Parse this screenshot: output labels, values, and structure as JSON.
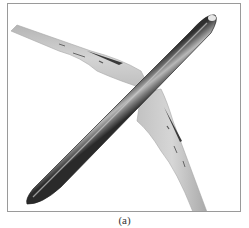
{
  "figure": {
    "caption": "(a)",
    "view": "top-down oblique view of swept-wing aircraft fuselage and wings",
    "colors": {
      "frame_border": "#9a9a9a",
      "background": "#ffffff",
      "fuselage_dark": "#3c3c3c",
      "fuselage_mid": "#7a7a7a",
      "fuselage_light": "#bdbdbd",
      "wing_surface": "#c9c9c9",
      "wing_edge": "#a6a6a6",
      "flap_marks": "#3a3a3a"
    }
  }
}
